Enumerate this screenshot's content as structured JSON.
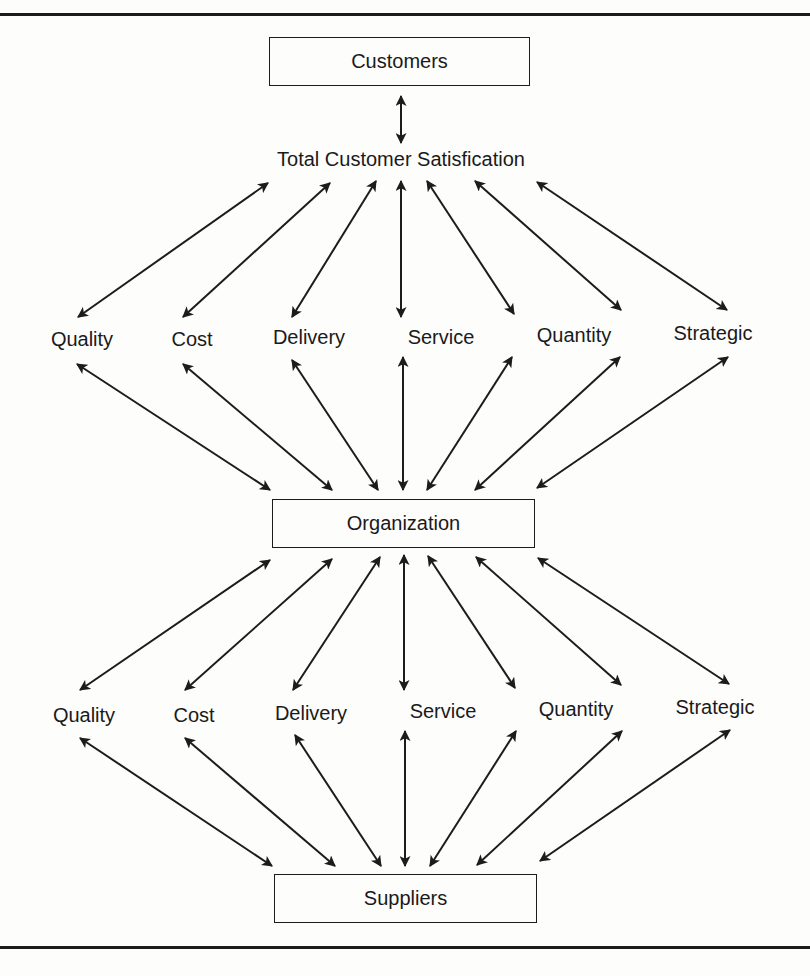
{
  "diagram": {
    "top_box": {
      "label": "Customers"
    },
    "goal_label": "Total Customer Satisfication",
    "middle_box": {
      "label": "Organization"
    },
    "bottom_box": {
      "label": "Suppliers"
    },
    "upper_factors": [
      {
        "label": "Quality"
      },
      {
        "label": "Cost"
      },
      {
        "label": "Delivery"
      },
      {
        "label": "Service"
      },
      {
        "label": "Quantity"
      },
      {
        "label": "Strategic"
      }
    ],
    "lower_factors": [
      {
        "label": "Quality"
      },
      {
        "label": "Cost"
      },
      {
        "label": "Delivery"
      },
      {
        "label": "Service"
      },
      {
        "label": "Quantity"
      },
      {
        "label": "Strategic"
      }
    ],
    "line_color": "#1c1c1c",
    "background_color": "#fdfdfc"
  }
}
